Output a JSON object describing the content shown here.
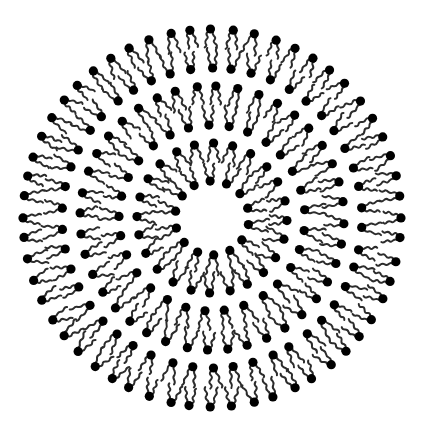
{
  "diagram": {
    "subject": "multilamellar vesicle",
    "background": "#ffffff",
    "center": {
      "x": 212,
      "y": 218
    },
    "head_color": "#000000",
    "tail_color": "#2b2b2b",
    "head_radius": 4.6,
    "tail_length": 16,
    "tail_width": 2.0,
    "bilayers": [
      {
        "name": "outer-bilayer",
        "outer_leaflet": {
          "radius": 189,
          "count": 56,
          "phase": 0.0
        },
        "inner_leaflet": {
          "radius": 150,
          "count": 46,
          "phase": 0.5
        }
      },
      {
        "name": "middle-bilayer",
        "outer_leaflet": {
          "radius": 132,
          "count": 40,
          "phase": 0.25
        },
        "inner_leaflet": {
          "radius": 93,
          "count": 29,
          "phase": 0.6
        }
      },
      {
        "name": "inner-bilayer",
        "outer_leaflet": {
          "radius": 75,
          "count": 24,
          "phase": 0.1
        },
        "inner_leaflet": {
          "radius": 37,
          "count": 14,
          "phase": 0.4
        }
      }
    ],
    "core": {
      "name": "aqueous-core",
      "radius": 30,
      "color": "#ffffff"
    }
  }
}
